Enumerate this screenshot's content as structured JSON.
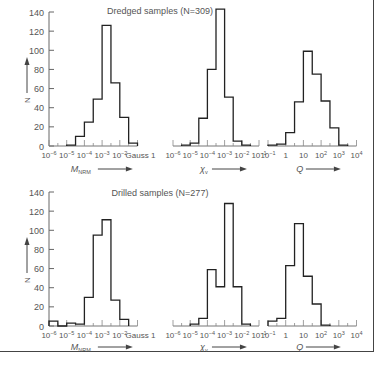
{
  "chart_data": [
    {
      "type": "bar",
      "title": "Dredged samples (N=309)",
      "panel": "top",
      "ylabel": "N",
      "ylim": [
        0,
        140
      ],
      "yticks": [
        0,
        20,
        40,
        60,
        80,
        100,
        120,
        140
      ],
      "subplots": [
        {
          "xlabel": "M_NRM",
          "xunit": "Gauss",
          "xscale": "log",
          "xticks": [
            "10^-6",
            "10^-5",
            "10^-4",
            "10^-3",
            "10^-2",
            "Gauss 1"
          ],
          "bin_edges_log10": [
            -5,
            -4.5,
            -4,
            -3.5,
            -3,
            -2.5,
            -2,
            -1.5,
            -1
          ],
          "values": [
            1,
            10,
            25,
            49,
            126,
            66,
            30,
            3
          ]
        },
        {
          "xlabel": "χv",
          "xscale": "log",
          "xticks": [
            "10^-6",
            "10^-5",
            "10^-4",
            "10^-3",
            "10^-2",
            "10^-1"
          ],
          "bin_edges_log10": [
            -5.5,
            -5,
            -4.5,
            -4,
            -3.5,
            -3,
            -2.5,
            -2,
            -1.5
          ],
          "values": [
            1,
            3,
            29,
            80,
            143,
            51,
            5,
            1
          ]
        },
        {
          "xlabel": "Q",
          "xscale": "log",
          "xticks": [
            "10^-1",
            "1",
            "10",
            "10^2",
            "10^3",
            "10^4"
          ],
          "bin_edges_log10": [
            -1,
            -0.5,
            0,
            0.5,
            1,
            1.5,
            2,
            2.5,
            3,
            3.5
          ],
          "values": [
            1,
            2,
            14,
            46,
            99,
            75,
            47,
            19,
            1
          ]
        }
      ]
    },
    {
      "type": "bar",
      "title": "Drilled samples (N=277)",
      "panel": "bottom",
      "ylabel": "N",
      "ylim": [
        0,
        140
      ],
      "yticks": [
        0,
        20,
        40,
        60,
        80,
        100,
        120,
        140
      ],
      "subplots": [
        {
          "xlabel": "M_NRM",
          "xunit": "Gauss",
          "xscale": "log",
          "xticks": [
            "10^-6",
            "10^-5",
            "10^-4",
            "10^-3",
            "10^-2",
            "Gauss 1"
          ],
          "bin_edges_log10": [
            -6,
            -5.5,
            -5,
            -4.5,
            -4,
            -3.5,
            -3,
            -2.5,
            -2,
            -1.5
          ],
          "values": [
            5,
            0,
            3,
            2,
            30,
            95,
            111,
            27,
            7
          ]
        },
        {
          "xlabel": "χv",
          "xscale": "log",
          "xticks": [
            "10^-6",
            "10^-5",
            "10^-4",
            "10^-3",
            "10^-2",
            "10^-1"
          ],
          "bin_edges_log10": [
            -5,
            -4.5,
            -4,
            -3.5,
            -3,
            -2.5,
            -2,
            -1.5
          ],
          "values": [
            2,
            8,
            59,
            41,
            128,
            41,
            2
          ]
        },
        {
          "xlabel": "Q",
          "xscale": "log",
          "xticks": [
            "10^-1",
            "1",
            "10",
            "10^2",
            "10^3",
            "10^4"
          ],
          "bin_edges_log10": [
            -1,
            -0.5,
            0,
            0.5,
            1,
            1.5,
            2,
            2.5
          ],
          "values": [
            5,
            8,
            63,
            107,
            52,
            23,
            1
          ]
        }
      ]
    }
  ],
  "labels": {
    "top_title": "Dredged samples (N=309)",
    "bottom_title": "Drilled samples (N=277)",
    "ylabel": "N",
    "m_label": "M",
    "m_sub": "NRM",
    "chi_label": "χ",
    "chi_sub": "v",
    "q_label": "Q"
  }
}
